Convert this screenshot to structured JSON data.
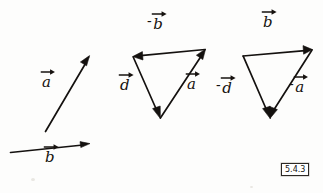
{
  "figure": {
    "caption_tag": "5.4.3",
    "background_color": "#fdfdfc",
    "ink_color": "#14110f",
    "panels": [
      {
        "name": "given-vectors",
        "title": "",
        "vectors": [
          {
            "label": "a",
            "sign": "",
            "from": [
              45,
              131
            ],
            "to": [
              89,
              56
            ],
            "label_pos": [
              41,
              82
            ]
          },
          {
            "label": "b",
            "sign": "",
            "from": [
              10,
              152
            ],
            "to": [
              89,
              144
            ],
            "label_pos": [
              44,
              155
            ]
          }
        ]
      },
      {
        "name": "triangle-d-minus-b-a",
        "title": "",
        "vectors": [
          {
            "label": "b",
            "sign": "-",
            "from": [
              205,
              50
            ],
            "to": [
              133,
              57
            ],
            "label_pos": [
              150,
              19
            ]
          },
          {
            "label": "d",
            "sign": "",
            "from": [
              133,
              57
            ],
            "to": [
              160,
              118
            ],
            "label_pos": [
              119,
              82
            ]
          },
          {
            "label": "a",
            "sign": "",
            "from": [
              160,
              118
            ],
            "to": [
              205,
              50
            ],
            "label_pos": [
              188,
              80
            ]
          }
        ]
      },
      {
        "name": "triangle-minus-d-b-minus-a",
        "title": "",
        "vectors": [
          {
            "label": "b",
            "sign": "",
            "from": [
              243,
              56
            ],
            "to": [
              312,
              50
            ],
            "label_pos": [
              262,
              20
            ]
          },
          {
            "label": "d",
            "sign": "-",
            "from": [
              243,
              56
            ],
            "to": [
              270,
              118
            ],
            "label_pos": [
              218,
              82
            ]
          },
          {
            "label": "a",
            "sign": "-",
            "from": [
              312,
              50
            ],
            "to": [
              270,
              118
            ],
            "label_pos": [
              290,
              80
            ]
          }
        ]
      }
    ],
    "all_labels": [
      "a",
      "b",
      "-b",
      "d",
      "a",
      "b",
      "-d",
      "-a"
    ]
  }
}
